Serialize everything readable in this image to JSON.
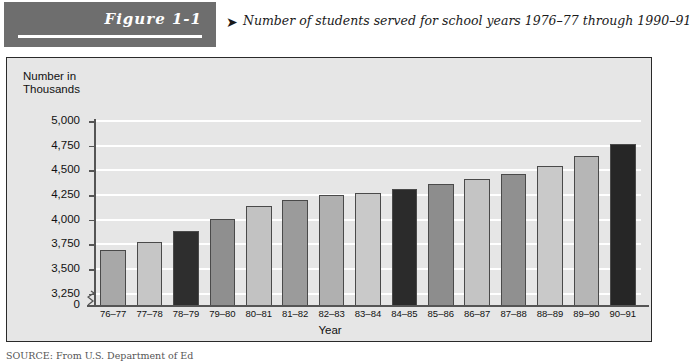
{
  "header": {
    "figure_label": "Figure 1-1",
    "caption_arrow": "➤",
    "caption": "Number of students served for school years 1976–77 through 1990–91"
  },
  "panel": {
    "y_axis_title_line1": "Number in",
    "y_axis_title_line2": "Thousands",
    "x_axis_title": "Year",
    "background_color": "#e6e6e6",
    "gridline_color": "#ffffff",
    "axis_color": "#555555"
  },
  "source": {
    "text": "SOURCE: From U.S. Department of Ed"
  },
  "chart_data": {
    "type": "bar",
    "title": "Number of students served for school years 1976–77 through 1990–91",
    "xlabel": "Year",
    "ylabel": "Number in Thousands",
    "ylim": [
      3125,
      5000
    ],
    "y_axis_break": true,
    "y_axis_break_between": [
      0,
      3250
    ],
    "grid": true,
    "legend": "none",
    "yticks": [
      0,
      3250,
      3500,
      3750,
      4000,
      4250,
      4500,
      4750,
      5000
    ],
    "ytick_labels": [
      "0",
      "3,250",
      "3,500",
      "3,750",
      "4,000",
      "4,250",
      "4,500",
      "4,750",
      "5,000"
    ],
    "categories": [
      "76–77",
      "77–78",
      "78–79",
      "79–80",
      "80–81",
      "81–82",
      "82–83",
      "83–84",
      "84–85",
      "85–86",
      "86–87",
      "87–88",
      "88–89",
      "89–90",
      "90–91"
    ],
    "values": [
      3694,
      3777,
      3889,
      4005,
      4142,
      4198,
      4255,
      4268,
      4315,
      4363,
      4416,
      4461,
      4544,
      4641,
      4762
    ],
    "bar_colors": [
      "#a8a8a8",
      "#c6c6c6",
      "#2e2e2e",
      "#8f8f8f",
      "#c2c2c2",
      "#9b9b9b",
      "#b0b0b0",
      "#c9c9c9",
      "#2b2b2b",
      "#8d8d8d",
      "#c4c4c4",
      "#909090",
      "#c9c9c9",
      "#b6b6b6",
      "#262626"
    ],
    "bar_border_color": "#4a4a4a"
  }
}
